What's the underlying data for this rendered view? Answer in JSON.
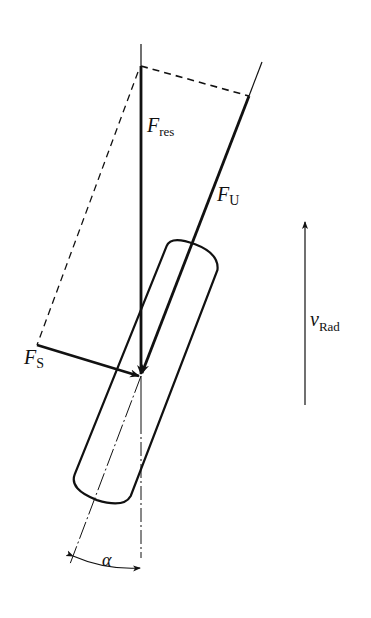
{
  "diagram": {
    "type": "force-diagram",
    "labels": {
      "f_res": {
        "main": "F",
        "sub": "res"
      },
      "f_u": {
        "main": "F",
        "sub": "U"
      },
      "f_s": {
        "main": "F",
        "sub": "S"
      },
      "v_rad": {
        "main": "v",
        "sub": "Rad"
      },
      "alpha": "α"
    },
    "colors": {
      "stroke": "#111111",
      "background": "#ffffff"
    }
  }
}
